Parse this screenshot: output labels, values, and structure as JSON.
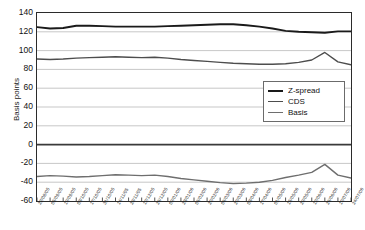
{
  "chart_data": {
    "type": "line",
    "title": "",
    "xlabel": "",
    "ylabel": "Basis points",
    "ylim": [
      -60,
      140
    ],
    "yticks": [
      140,
      120,
      100,
      80,
      60,
      40,
      20,
      0,
      -20,
      -40,
      -60
    ],
    "grid": true,
    "legend_position": "right-middle",
    "categories": [
      "22/08/05",
      "05/09/05",
      "19/09/05",
      "03/10/05",
      "17/10/05",
      "31/10/05",
      "14/11/05",
      "28/11/05",
      "12/12/05",
      "26/12/05",
      "09/01/06",
      "23/01/06",
      "06/02/06",
      "20/02/06",
      "06/03/06",
      "20/03/06",
      "03/04/06",
      "17/04/06",
      "01/05/06",
      "15/05/06",
      "29/05/06",
      "12/06/06",
      "26/06/06",
      "10/07/06",
      "24/07/06"
    ],
    "xtick_labels": [
      "22/08/05",
      "05/09/05",
      "19/09/05",
      "03/10/05",
      "17/10/05",
      "31/10/05",
      "14/11/05",
      "28/11/05",
      "12/12/05",
      "26/12/05",
      "09/01/06",
      "23/01/06",
      "06/02/06",
      "20/02/06",
      "06/03/06",
      "20/03/06",
      "03/04/06",
      "17/04/06",
      "01/05/06",
      "15/05/06",
      "29/05/06",
      "12/06/06",
      "26/06/06",
      "10/07/06",
      "24/07/06"
    ],
    "series": [
      {
        "name": "Z-spread",
        "color": "#1a1a1a",
        "width": 1.9,
        "values": [
          125,
          123.5,
          124,
          126.5,
          126.5,
          126,
          125.5,
          125.5,
          125.5,
          125.5,
          126,
          126.5,
          127,
          127.5,
          128,
          128,
          127,
          125.5,
          123.5,
          121,
          120,
          119.5,
          119,
          120.5,
          120.5
        ]
      },
      {
        "name": "CDS",
        "color": "#4d4d4d",
        "width": 1.4,
        "values": [
          91,
          90.5,
          91,
          92,
          92.5,
          93,
          93.5,
          93,
          92.5,
          93,
          92,
          90.5,
          89.5,
          88.5,
          87.5,
          86.5,
          86,
          85.5,
          85.5,
          86,
          87.5,
          90,
          98,
          88,
          85
        ]
      },
      {
        "name": "Basis",
        "color": "#6e6e6e",
        "width": 1.4,
        "values": [
          -34,
          -33,
          -33.5,
          -34.5,
          -34,
          -33,
          -32,
          -32.5,
          -33,
          -32.5,
          -34,
          -36,
          -37.5,
          -39,
          -40.5,
          -41.5,
          -41,
          -40,
          -38,
          -35,
          -32.5,
          -29.5,
          -21,
          -32.5,
          -35.5
        ]
      }
    ]
  },
  "legend": {
    "items": [
      {
        "label": "Z-spread",
        "color": "#1a1a1a",
        "thickness": "2.2px"
      },
      {
        "label": "CDS",
        "color": "#4d4d4d",
        "thickness": "1.4px"
      },
      {
        "label": "Basis",
        "color": "#6e6e6e",
        "thickness": "1.4px"
      }
    ]
  }
}
